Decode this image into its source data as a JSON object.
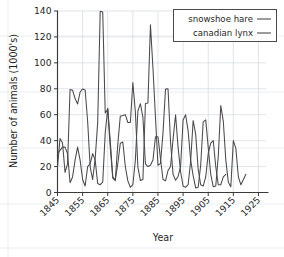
{
  "chart_data": {
    "type": "line",
    "title": "",
    "xlabel": "Year",
    "ylabel": "Number of animals (1000's)",
    "xlim": [
      1845,
      1928
    ],
    "ylim": [
      0,
      140
    ],
    "grid": true,
    "legend_position": "top-right",
    "xticks": [
      "1845",
      "1855",
      "1865",
      "1875",
      "1885",
      "1895",
      "1905",
      "1915",
      "1925"
    ],
    "xtick_values": [
      1845,
      1855,
      1865,
      1875,
      1885,
      1895,
      1905,
      1915,
      1925
    ],
    "yticks": [
      "0",
      "20",
      "40",
      "60",
      "80",
      "100",
      "120",
      "140"
    ],
    "ytick_values": [
      0,
      20,
      40,
      60,
      80,
      100,
      120,
      140
    ],
    "x": [
      1845,
      1846,
      1847,
      1848,
      1849,
      1850,
      1851,
      1852,
      1853,
      1854,
      1855,
      1856,
      1857,
      1858,
      1859,
      1860,
      1861,
      1862,
      1863,
      1864,
      1865,
      1866,
      1867,
      1868,
      1869,
      1870,
      1871,
      1872,
      1873,
      1874,
      1875,
      1876,
      1877,
      1878,
      1879,
      1880,
      1881,
      1882,
      1883,
      1884,
      1885,
      1886,
      1887,
      1888,
      1889,
      1890,
      1891,
      1892,
      1893,
      1894,
      1895,
      1896,
      1897,
      1898,
      1899,
      1900,
      1901,
      1902,
      1903,
      1904,
      1905,
      1906,
      1907,
      1908,
      1909,
      1910,
      1911,
      1912,
      1913,
      1914,
      1915,
      1916,
      1917,
      1918,
      1919,
      1920
    ],
    "series": [
      {
        "name": "snowshoe hare",
        "color": "#4a4a4a",
        "values": [
          20,
          20,
          52,
          83,
          64,
          68,
          83,
          12,
          36,
          150,
          110,
          60,
          7,
          10,
          70,
          100,
          92,
          70,
          10,
          11,
          137,
          137,
          18,
          22,
          52,
          83,
          18,
          10,
          9,
          65,
          60,
          81,
          80,
          12,
          38,
          74,
          75,
          80,
          11,
          8,
          9,
          137,
          137,
          18,
          22,
          52,
          83,
          18,
          10,
          9,
          65,
          60,
          81,
          80,
          12,
          38,
          74,
          75,
          80,
          11,
          8,
          9,
          35,
          52,
          60,
          18,
          10,
          9,
          65,
          60,
          40,
          12,
          38,
          10,
          15,
          17
        ]
      },
      {
        "name": "canadian lynx",
        "color": "#4a4a4a",
        "values": [
          32,
          50,
          12,
          10,
          13,
          36,
          15,
          12,
          6,
          6,
          65,
          70,
          40,
          9,
          20,
          34,
          45,
          40,
          15,
          15,
          60,
          80,
          26,
          18,
          37,
          50,
          35,
          12,
          12,
          25,
          37,
          45,
          25,
          15,
          15,
          60,
          80,
          26,
          18,
          37,
          50,
          35,
          12,
          12,
          25,
          37,
          45,
          25,
          15,
          15,
          60,
          80,
          26,
          18,
          37,
          50,
          35,
          12,
          12,
          25,
          37,
          45,
          25,
          15,
          15,
          60,
          80,
          26,
          18,
          37,
          50,
          35,
          12,
          12,
          25,
          37
        ]
      }
    ],
    "hare_values": [
      19.6,
      41.7,
      38.1,
      15.5,
      22.1,
      79.4,
      78.8,
      72.5,
      68.3,
      77.5,
      79.9,
      79.1,
      54.9,
      19.8,
      10.0,
      26.1,
      53.9,
      139.8,
      139.3,
      61.4,
      64.1,
      35.0,
      11.1,
      9.2,
      37.1,
      58.9,
      59.4,
      60.0,
      54.0,
      54.0,
      84.9,
      62.0,
      19.6,
      9.2,
      10.0,
      68.6,
      69.0,
      129.4,
      96.0,
      58.0,
      21.0,
      22.5,
      46.0,
      79.8,
      80.0,
      39.0,
      14.0,
      9.5,
      12.4,
      20.0,
      56.0,
      60.0,
      47.5,
      25.0,
      13.0,
      3.5,
      4.0,
      21.0,
      54.5,
      56.0,
      35.0,
      14.0,
      4.5,
      5.0,
      28.0,
      67.0,
      55.0,
      25.0,
      8.0,
      4.5,
      40.0,
      34.0,
      12.0,
      6.0,
      10.0,
      14.0
    ],
    "lynx_values": [
      30.0,
      32.5,
      35.0,
      35.0,
      30.0,
      7.5,
      12.0,
      25.0,
      35.0,
      25.0,
      10.0,
      5.0,
      20.0,
      22.0,
      30.0,
      25.0,
      7.0,
      6.0,
      8.0,
      46.0,
      65.0,
      40.0,
      12.0,
      9.5,
      22.0,
      38.0,
      39.0,
      20.0,
      9.0,
      4.0,
      6.0,
      25.0,
      63.0,
      68.5,
      58.0,
      22.0,
      20.0,
      21.0,
      25.0,
      43.0,
      43.0,
      26.0,
      10.0,
      9.0,
      17.0,
      20.0,
      41.0,
      60.0,
      35.0,
      16.0,
      5.0,
      4.0,
      6.0,
      24.0,
      55.5,
      45.0,
      18.0,
      6.0,
      5.0,
      12.0,
      30.0,
      38.0,
      40.0,
      20.0,
      6.0,
      6.0,
      12.0,
      14.0
    ]
  },
  "legend": {
    "items": [
      {
        "label": "snowshoe hare",
        "marker": "line-sample"
      },
      {
        "label": "canadian lynx",
        "marker": "line-sample"
      }
    ]
  },
  "axes": {
    "y_title": "Number of animals (1000's)",
    "x_title": "Year"
  }
}
